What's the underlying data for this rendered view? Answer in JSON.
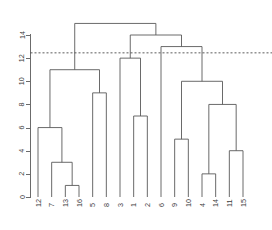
{
  "chart_data": {
    "type": "dendrogram",
    "title": "",
    "xlabel": "",
    "ylabel": "",
    "ylim": [
      0,
      15.2
    ],
    "yticks": [
      0,
      2,
      4,
      6,
      8,
      10,
      12,
      14
    ],
    "ytick_labels": [
      "0",
      "2",
      "4",
      "6",
      "8",
      "10",
      "12",
      "14"
    ],
    "grid": false,
    "legend": "none",
    "leaf_order": [
      "12",
      "7",
      "13",
      "16",
      "5",
      "8",
      "3",
      "1",
      "2",
      "6",
      "9",
      "10",
      "4",
      "14",
      "11",
      "15"
    ],
    "leaf_labels": [
      "12",
      "7",
      "13",
      "16",
      "5",
      "8",
      "3",
      "1",
      "2",
      "6",
      "9",
      "10",
      "4",
      "14",
      "11",
      "15"
    ],
    "merges": [
      {
        "id": "m1",
        "left": "13",
        "right": "16",
        "height": 1
      },
      {
        "id": "m2",
        "left": "4",
        "right": "14",
        "height": 2
      },
      {
        "id": "m3",
        "left": "7",
        "right": "m1",
        "height": 3
      },
      {
        "id": "m4",
        "left": "11",
        "right": "15",
        "height": 4
      },
      {
        "id": "m5",
        "left": "9",
        "right": "10",
        "height": 5
      },
      {
        "id": "m6",
        "left": "12",
        "right": "m3",
        "height": 6
      },
      {
        "id": "m7",
        "left": "1",
        "right": "2",
        "height": 7
      },
      {
        "id": "m8",
        "left": "m2",
        "right": "m4",
        "height": 8
      },
      {
        "id": "m9",
        "left": "5",
        "right": "8",
        "height": 9
      },
      {
        "id": "m10",
        "left": "m5",
        "right": "m8",
        "height": 10
      },
      {
        "id": "m11",
        "left": "m6",
        "right": "m9",
        "height": 11
      },
      {
        "id": "m12",
        "left": "3",
        "right": "m7",
        "height": 12
      },
      {
        "id": "m13",
        "left": "6",
        "right": "m10",
        "height": 13
      },
      {
        "id": "m14",
        "left": "m12",
        "right": "m13",
        "height": 14
      },
      {
        "id": "m15",
        "left": "m11",
        "right": "m14",
        "height": 15
      }
    ],
    "cut_line": {
      "value": 12.5,
      "style": "dashed"
    },
    "colors": {
      "link": "#595959",
      "axis": "#6b6b6b",
      "text": "#3a3a3a",
      "cut_line": "#4a4a4a",
      "background": "#ffffff"
    }
  }
}
